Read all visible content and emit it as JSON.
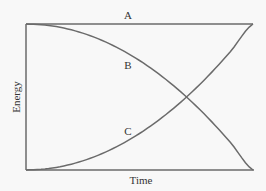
{
  "chart_data": {
    "type": "line",
    "title": "",
    "xlabel": "Time",
    "ylabel": "Energy",
    "xlim": [
      0,
      1
    ],
    "ylim": [
      0,
      1
    ],
    "grid": false,
    "legend": "none (curves labeled inline)",
    "x": [
      0,
      0.1,
      0.2,
      0.3,
      0.4,
      0.5,
      0.6,
      0.7,
      0.8,
      0.9,
      1.0
    ],
    "series": [
      {
        "name": "A",
        "values": [
          1,
          1,
          1,
          1,
          1,
          1,
          1,
          1,
          1,
          1,
          1
        ]
      },
      {
        "name": "B",
        "values": [
          1.0,
          0.99,
          0.96,
          0.91,
          0.84,
          0.75,
          0.64,
          0.51,
          0.36,
          0.19,
          0.0
        ]
      },
      {
        "name": "C",
        "values": [
          0.0,
          0.01,
          0.04,
          0.09,
          0.16,
          0.25,
          0.36,
          0.49,
          0.64,
          0.81,
          1.0
        ]
      }
    ],
    "annotations": [
      {
        "text": "A",
        "near": "top horizontal line, center"
      },
      {
        "text": "B",
        "near": "descending curve"
      },
      {
        "text": "C",
        "near": "ascending curve"
      }
    ]
  },
  "labels": {
    "x_axis": "Time",
    "y_axis": "Energy",
    "series_a": "A",
    "series_b": "B",
    "series_c": "C"
  },
  "colors": {
    "line": "#6b6b6b",
    "background": "#f8f8f8",
    "text": "#333333"
  }
}
